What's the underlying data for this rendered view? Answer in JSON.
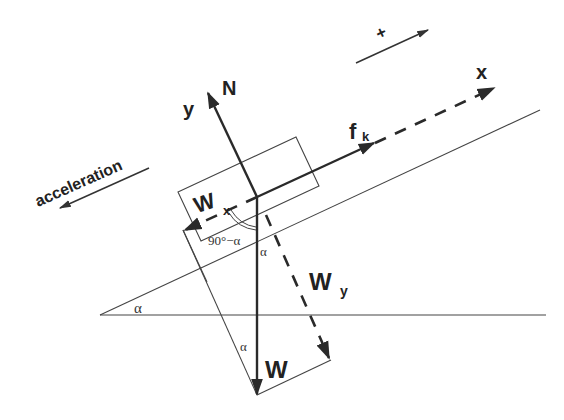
{
  "diagram": {
    "labels": {
      "positive_direction": "+",
      "x_axis": "x",
      "y_axis": "y",
      "normal_force": "N",
      "friction_main": "f",
      "friction_sub": "k",
      "weight_x_main": "W",
      "weight_x_sub": "x",
      "weight_y_main": "W",
      "weight_y_sub": "y",
      "weight": "W",
      "acceleration": "acceleration",
      "complement_angle": "90°−α",
      "angle_incline": "α",
      "angle_at_block": "α",
      "angle_at_weight": "α"
    },
    "colors": {
      "line": "#2a2a2a",
      "background": "#ffffff"
    }
  }
}
